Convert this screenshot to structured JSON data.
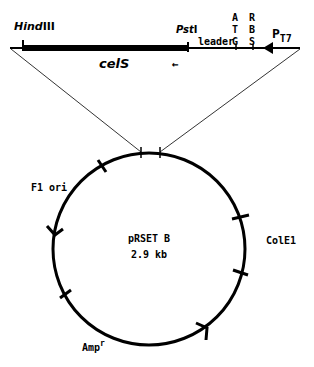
{
  "diagram": {
    "type": "plasmid-map",
    "insert": {
      "gene_label": "celS",
      "sites": {
        "left": "HindIII",
        "left_italic": "Hind",
        "left_roman": "III",
        "right": "PstI",
        "right_italic": "Pst",
        "right_roman": "I"
      },
      "leader_label": "leader",
      "atg_letters": [
        "A",
        "T",
        "G"
      ],
      "rbs_letters": [
        "R",
        "B",
        "S"
      ],
      "promoter_label": "P",
      "promoter_sub": "T7",
      "direction_arrow": "←"
    },
    "plasmid": {
      "name": "pRSET B",
      "size": "2.9 kb",
      "features": [
        {
          "label": "F1 ori"
        },
        {
          "label": "ColE1"
        },
        {
          "label": "Amp",
          "superscript": "r"
        }
      ]
    },
    "colors": {
      "line": "#000000",
      "background": "#ffffff"
    }
  }
}
